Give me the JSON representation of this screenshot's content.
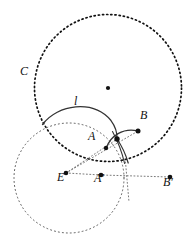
{
  "figure": {
    "background_color": "#ffffff",
    "stroke_color": "#111111",
    "labels": [
      {
        "name": "label-C",
        "text": "C",
        "x": 20,
        "y": 72,
        "style": "italic"
      },
      {
        "name": "label-l",
        "text": "l",
        "x": 74,
        "y": 102,
        "style": "italic"
      },
      {
        "name": "label-A",
        "text": "A",
        "x": 89,
        "y": 137,
        "style": "italic"
      },
      {
        "name": "label-B",
        "text": "B",
        "x": 140,
        "y": 116,
        "style": "italic"
      },
      {
        "name": "label-E",
        "text": "E",
        "x": 57,
        "y": 177,
        "style": "italic"
      },
      {
        "name": "label-A-prime",
        "text": "A′",
        "x": 94,
        "y": 178,
        "style": "italic"
      },
      {
        "name": "label-B-prime",
        "text": "B′",
        "x": 164,
        "y": 182,
        "style": "italic"
      }
    ],
    "circles": [
      {
        "name": "circle-C",
        "label": "C",
        "cx": 108,
        "cy": 88,
        "r": 73.5,
        "stroke": "#111111",
        "stroke_width": 1.6,
        "dash": "1.2 3.0",
        "fill": "none"
      },
      {
        "name": "circle-E",
        "label": "E",
        "cx": 69,
        "cy": 178,
        "r": 55,
        "stroke": "#555555",
        "stroke_width": 1.0,
        "dash": "1.0 3.0",
        "fill": "none"
      }
    ],
    "points": [
      {
        "name": "point-center-C",
        "label": "",
        "x": 108,
        "y": 88,
        "r": 2.1
      },
      {
        "name": "point-A",
        "label": "A",
        "x": 106,
        "y": 148,
        "r": 2.1
      },
      {
        "name": "point-B",
        "label": "B",
        "x": 138,
        "y": 131,
        "r": 2.4
      },
      {
        "name": "point-arc-top",
        "label": "",
        "x": 117,
        "y": 139,
        "r": 2.6
      },
      {
        "name": "point-E",
        "label": "E",
        "x": 66,
        "y": 173,
        "r": 2.3
      },
      {
        "name": "point-A-prime",
        "label": "A′",
        "x": 101,
        "y": 175,
        "r": 2.3
      },
      {
        "name": "point-B-prime",
        "label": "B′",
        "x": 170,
        "y": 177,
        "r": 2.3
      }
    ],
    "arcs": [
      {
        "name": "arc-l",
        "label": "l",
        "path": "M 42.5,124.5 C 60,105 95,101 112,122 C 116,128 117.5,134 117,139",
        "stroke": "#333333",
        "stroke_width": 1.2
      },
      {
        "name": "arc-l-lower",
        "label": "",
        "path": "M 117,139 C 122,146 126,154 128.5,163",
        "stroke": "#333333",
        "stroke_width": 1.2
      },
      {
        "name": "arc-A-to-B",
        "label": "",
        "path": "M 106,148 C 110,136 124,128 138,131",
        "stroke": "#333333",
        "stroke_width": 1.2
      },
      {
        "name": "arc-through-intersection",
        "label": "",
        "path": "M 112,132 C 118,142 122,152 124.5,163.5",
        "stroke": "#333333",
        "stroke_width": 1.1
      }
    ],
    "rays": [
      {
        "name": "ray-E-to-A-prime-to-B-prime",
        "from": "E",
        "to": "B′",
        "path": "M 66,173 L 101,175 L 170,177",
        "stroke": "#666666",
        "stroke_width": 0.9,
        "dash": "1.0 2.4"
      },
      {
        "name": "ray-E-to-B",
        "from": "E",
        "to": "B",
        "path": "M 66,173 L 138,131",
        "stroke": "#666666",
        "stroke_width": 0.9,
        "dash": "1.0 2.4"
      },
      {
        "name": "ray-E-through-A",
        "from": "E",
        "to": "A",
        "path": "M 66,173 L 117,139",
        "stroke": "#666666",
        "stroke_width": 0.9,
        "dash": "1.0 2.4"
      },
      {
        "name": "ray-vertical-through-A-prime",
        "from": "circle-C bottom",
        "to": "below",
        "path": "M 126,163 L 128,200",
        "stroke": "#666666",
        "stroke_width": 0.9,
        "dash": "1.0 2.4"
      }
    ]
  }
}
